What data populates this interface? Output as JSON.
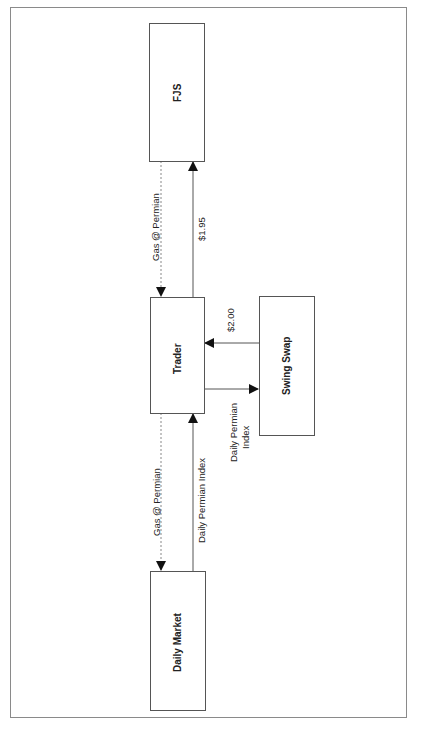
{
  "diagram": {
    "orientation": "rotated-90-ccw",
    "nodes": [
      {
        "id": "fjs",
        "label": "FJS"
      },
      {
        "id": "trader",
        "label": "Trader"
      },
      {
        "id": "swing_swap",
        "label": "Swing Swap"
      },
      {
        "id": "daily_market",
        "label": "Daily Market"
      }
    ],
    "edges": [
      {
        "from": "fjs",
        "to": "trader",
        "label": "Gas @ Permian",
        "style": "dotted"
      },
      {
        "from": "trader",
        "to": "fjs",
        "label": "$1.95",
        "style": "solid"
      },
      {
        "from": "swing_swap",
        "to": "trader",
        "label": "$2.00",
        "style": "solid"
      },
      {
        "from": "trader",
        "to": "swing_swap",
        "label": "Daily Permian Index",
        "style": "solid"
      },
      {
        "from": "trader",
        "to": "daily_market",
        "label": "Gas @ Permian",
        "style": "dotted"
      },
      {
        "from": "daily_market",
        "to": "trader",
        "label": "Daily Permian Index",
        "style": "solid"
      }
    ]
  },
  "labels": {
    "fjs": "FJS",
    "trader": "Trader",
    "swing_swap": "Swing Swap",
    "daily_market": "Daily Market",
    "fjs_to_trader": "Gas @ Permian",
    "trader_to_fjs": "$1.95",
    "swap_to_trader": "$2.00",
    "trader_to_swap_line1": "Daily Permian",
    "trader_to_swap_line2": "Index",
    "trader_to_market": "Gas @ Permian",
    "market_to_trader": "Daily Permian Index"
  },
  "colors": {
    "line": "#555555",
    "dotted": "#888888",
    "text": "#222222"
  }
}
